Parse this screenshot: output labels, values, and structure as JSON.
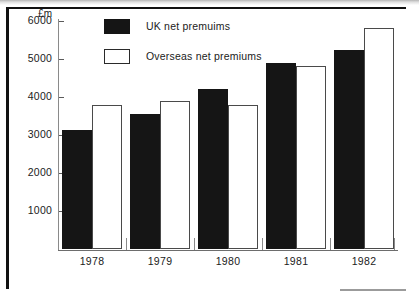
{
  "chart_data": {
    "type": "bar",
    "title": "",
    "xlabel": "",
    "ylabel": "£m",
    "ylim": [
      0,
      6000
    ],
    "grid": false,
    "legend_position": "top-center",
    "categories": [
      "1978",
      "1979",
      "1980",
      "1981",
      "1982"
    ],
    "ytick_labels": [
      "1000",
      "2000",
      "3000",
      "4000",
      "5000",
      "6000"
    ],
    "ytick_values": [
      1000,
      2000,
      3000,
      4000,
      5000,
      6000
    ],
    "series": [
      {
        "name": "UK net premuims",
        "color": "#151515",
        "values": [
          3130,
          3560,
          4210,
          4890,
          5250
        ]
      },
      {
        "name": "Overseas net premiums",
        "color": "#ffffff",
        "values": [
          3800,
          3890,
          3780,
          4810,
          5810
        ]
      }
    ]
  },
  "axis": {
    "unit_label": "£m"
  },
  "legend": {
    "items": [
      {
        "label": "UK net premuims",
        "swatch": "filled-black-square"
      },
      {
        "label": "Overseas net premiums",
        "swatch": "outlined-white-square"
      }
    ]
  }
}
